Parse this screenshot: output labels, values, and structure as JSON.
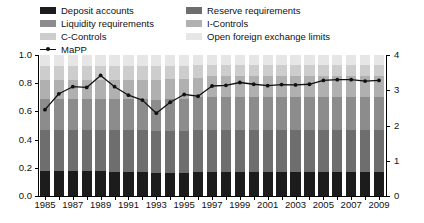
{
  "legend": {
    "items": [
      {
        "label": "Deposit accounts",
        "key": "deposit_accounts",
        "color": "#1c1c1c",
        "type": "swatch"
      },
      {
        "label": "Reserve requirements",
        "key": "reserve_requirements",
        "color": "#6e6e6e",
        "type": "swatch"
      },
      {
        "label": "Liquidity requirements",
        "key": "liquidity_requirements",
        "color": "#8c8c8c",
        "type": "swatch"
      },
      {
        "label": "I-Controls",
        "key": "i_controls",
        "color": "#b0b0b0",
        "type": "swatch"
      },
      {
        "label": "C-Controls",
        "key": "c_controls",
        "color": "#cdcdcd",
        "type": "swatch"
      },
      {
        "label": "Open foreign exchange limits",
        "key": "open_fx_limits",
        "color": "#e6e6e6",
        "type": "swatch"
      },
      {
        "label": "MaPP",
        "key": "mapp",
        "color": "#111111",
        "type": "line"
      }
    ]
  },
  "chart_data": {
    "type": "bar",
    "stacked": true,
    "normalized": true,
    "title": "",
    "xlabel": "",
    "ylabel": "",
    "ylim": [
      0.0,
      1.0
    ],
    "ylim_right": [
      0,
      4
    ],
    "yticks": [
      "0.0",
      "0.2",
      "0.4",
      "0.6",
      "0.8",
      "1.0"
    ],
    "yticks_right": [
      "0",
      "1",
      "2",
      "3",
      "4"
    ],
    "grid": false,
    "legend_position": "top",
    "categories": [
      "1985",
      "1986",
      "1987",
      "1988",
      "1989",
      "1990",
      "1991",
      "1992",
      "1993",
      "1994",
      "1995",
      "1996",
      "1997",
      "1998",
      "1999",
      "2000",
      "2001",
      "2002",
      "2003",
      "2004",
      "2005",
      "2006",
      "2007",
      "2008",
      "2009"
    ],
    "xtick_labels": [
      "1985",
      "",
      "1987",
      "",
      "1989",
      "",
      "1991",
      "",
      "1993",
      "",
      "1995",
      "",
      "1997",
      "",
      "1999",
      "",
      "2001",
      "",
      "2003",
      "",
      "2005",
      "",
      "2007",
      "",
      "2009"
    ],
    "series": [
      {
        "name": "Deposit accounts",
        "color": "#1c1c1c",
        "values": [
          0.18,
          0.18,
          0.18,
          0.18,
          0.18,
          0.17,
          0.17,
          0.17,
          0.16,
          0.16,
          0.16,
          0.17,
          0.17,
          0.17,
          0.17,
          0.17,
          0.17,
          0.17,
          0.17,
          0.17,
          0.17,
          0.17,
          0.17,
          0.17,
          0.17
        ]
      },
      {
        "name": "Reserve requirements",
        "color": "#6e6e6e",
        "values": [
          0.29,
          0.29,
          0.29,
          0.29,
          0.29,
          0.3,
          0.3,
          0.3,
          0.3,
          0.3,
          0.3,
          0.3,
          0.3,
          0.3,
          0.3,
          0.3,
          0.3,
          0.3,
          0.3,
          0.3,
          0.3,
          0.3,
          0.3,
          0.3,
          0.3
        ]
      },
      {
        "name": "Liquidity requirements",
        "color": "#8c8c8c",
        "values": [
          0.22,
          0.22,
          0.22,
          0.22,
          0.22,
          0.22,
          0.22,
          0.22,
          0.22,
          0.23,
          0.23,
          0.23,
          0.23,
          0.23,
          0.23,
          0.23,
          0.23,
          0.23,
          0.23,
          0.23,
          0.23,
          0.23,
          0.23,
          0.23,
          0.23
        ]
      },
      {
        "name": "I-Controls",
        "color": "#b0b0b0",
        "values": [
          0.13,
          0.13,
          0.13,
          0.13,
          0.13,
          0.13,
          0.13,
          0.13,
          0.14,
          0.14,
          0.14,
          0.14,
          0.15,
          0.15,
          0.15,
          0.15,
          0.15,
          0.15,
          0.15,
          0.15,
          0.15,
          0.15,
          0.15,
          0.15,
          0.15
        ]
      },
      {
        "name": "C-Controls",
        "color": "#cdcdcd",
        "values": [
          0.1,
          0.1,
          0.1,
          0.1,
          0.1,
          0.1,
          0.1,
          0.1,
          0.1,
          0.09,
          0.09,
          0.09,
          0.08,
          0.08,
          0.08,
          0.08,
          0.08,
          0.08,
          0.08,
          0.08,
          0.08,
          0.08,
          0.08,
          0.08,
          0.08
        ]
      },
      {
        "name": "Open foreign exchange limits",
        "color": "#e6e6e6",
        "values": [
          0.08,
          0.08,
          0.08,
          0.08,
          0.08,
          0.08,
          0.08,
          0.08,
          0.08,
          0.08,
          0.08,
          0.07,
          0.07,
          0.07,
          0.07,
          0.07,
          0.07,
          0.07,
          0.07,
          0.07,
          0.07,
          0.07,
          0.07,
          0.07,
          0.07
        ]
      }
    ],
    "line_series": {
      "name": "MaPP",
      "axis": "right",
      "color": "#111111",
      "marker": "circle",
      "values": [
        2.45,
        2.9,
        3.1,
        3.08,
        3.42,
        3.1,
        2.86,
        2.72,
        2.35,
        2.66,
        2.88,
        2.83,
        3.12,
        3.14,
        3.22,
        3.17,
        3.13,
        3.16,
        3.15,
        3.17,
        3.28,
        3.3,
        3.3,
        3.26,
        3.28
      ]
    }
  }
}
